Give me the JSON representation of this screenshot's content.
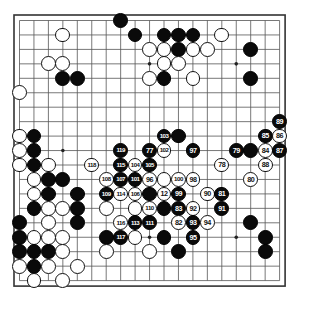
{
  "diagram": {
    "kind": "go-game-record",
    "board_size": 19,
    "colors": {
      "background": "#ffffff",
      "board_fill": "#ffffff",
      "grid_line": "#555555",
      "border_line": "#333333",
      "black_stone": "#0a0a0a",
      "white_stone": "#ffffff",
      "black_label_text": "#ffffff",
      "white_label_text": "#111111"
    },
    "geometry": {
      "origin_x": 19.5,
      "origin_y": 20.5,
      "spacing": 14.45,
      "stone_radius": 7.4,
      "hoshi_radius": 1.8,
      "border_pad": 5.5
    },
    "hoshi": [
      {
        "c": 3,
        "r": 3
      },
      {
        "c": 9,
        "r": 3
      },
      {
        "c": 15,
        "r": 3
      },
      {
        "c": 3,
        "r": 9
      },
      {
        "c": 9,
        "r": 9
      },
      {
        "c": 15,
        "r": 9
      },
      {
        "c": 3,
        "r": 15
      },
      {
        "c": 9,
        "r": 15
      },
      {
        "c": 15,
        "r": 15
      }
    ],
    "stones": [
      {
        "c": 8,
        "r": 1,
        "color": "black",
        "label": ""
      },
      {
        "c": 9,
        "r": 2,
        "color": "black",
        "label": ""
      },
      {
        "c": 11,
        "r": 2,
        "color": "black",
        "label": ""
      },
      {
        "c": 12,
        "r": 2,
        "color": "black",
        "label": ""
      },
      {
        "c": 13,
        "r": 2,
        "color": "black",
        "label": ""
      },
      {
        "c": 4,
        "r": 2,
        "color": "white",
        "label": ""
      },
      {
        "c": 15,
        "r": 2,
        "color": "white",
        "label": ""
      },
      {
        "c": 10,
        "r": 3,
        "color": "white",
        "label": ""
      },
      {
        "c": 11,
        "r": 3,
        "color": "white",
        "label": ""
      },
      {
        "c": 12,
        "r": 3,
        "color": "black",
        "label": ""
      },
      {
        "c": 13,
        "r": 3,
        "color": "white",
        "label": ""
      },
      {
        "c": 14,
        "r": 3,
        "color": "white",
        "label": ""
      },
      {
        "c": 17,
        "r": 3,
        "color": "black",
        "label": ""
      },
      {
        "c": 3,
        "r": 4,
        "color": "white",
        "label": ""
      },
      {
        "c": 4,
        "r": 4,
        "color": "white",
        "label": ""
      },
      {
        "c": 11,
        "r": 4,
        "color": "white",
        "label": ""
      },
      {
        "c": 12,
        "r": 4,
        "color": "white",
        "label": ""
      },
      {
        "c": 4,
        "r": 5,
        "color": "black",
        "label": ""
      },
      {
        "c": 5,
        "r": 5,
        "color": "black",
        "label": ""
      },
      {
        "c": 10,
        "r": 5,
        "color": "white",
        "label": ""
      },
      {
        "c": 11,
        "r": 5,
        "color": "black",
        "label": ""
      },
      {
        "c": 13,
        "r": 5,
        "color": "white",
        "label": ""
      },
      {
        "c": 17,
        "r": 5,
        "color": "black",
        "label": ""
      },
      {
        "c": 1,
        "r": 6,
        "color": "white",
        "label": ""
      },
      {
        "c": 19,
        "r": 8,
        "color": "black",
        "label": "89"
      },
      {
        "c": 1,
        "r": 9,
        "color": "white",
        "label": ""
      },
      {
        "c": 2,
        "r": 9,
        "color": "black",
        "label": ""
      },
      {
        "c": 11,
        "r": 9,
        "color": "black",
        "label": "103"
      },
      {
        "c": 12,
        "r": 9,
        "color": "black",
        "label": ""
      },
      {
        "c": 18,
        "r": 9,
        "color": "black",
        "label": "85"
      },
      {
        "c": 19,
        "r": 9,
        "color": "white",
        "label": "86"
      },
      {
        "c": 1,
        "r": 10,
        "color": "white",
        "label": ""
      },
      {
        "c": 2,
        "r": 10,
        "color": "black",
        "label": ""
      },
      {
        "c": 8,
        "r": 10,
        "color": "black",
        "label": "119"
      },
      {
        "c": 10,
        "r": 10,
        "color": "black",
        "label": "77"
      },
      {
        "c": 11,
        "r": 10,
        "color": "white",
        "label": "102"
      },
      {
        "c": 13,
        "r": 10,
        "color": "black",
        "label": "97"
      },
      {
        "c": 16,
        "r": 10,
        "color": "black",
        "label": "79"
      },
      {
        "c": 17,
        "r": 10,
        "color": "black",
        "label": ""
      },
      {
        "c": 18,
        "r": 10,
        "color": "white",
        "label": "84"
      },
      {
        "c": 19,
        "r": 10,
        "color": "black",
        "label": "87"
      },
      {
        "c": 1,
        "r": 11,
        "color": "white",
        "label": ""
      },
      {
        "c": 2,
        "r": 11,
        "color": "black",
        "label": ""
      },
      {
        "c": 3,
        "r": 11,
        "color": "white",
        "label": ""
      },
      {
        "c": 6,
        "r": 11,
        "color": "white",
        "label": "118"
      },
      {
        "c": 8,
        "r": 11,
        "color": "black",
        "label": "115"
      },
      {
        "c": 9,
        "r": 11,
        "color": "white",
        "label": "104"
      },
      {
        "c": 10,
        "r": 11,
        "color": "black",
        "label": "105"
      },
      {
        "c": 15,
        "r": 11,
        "color": "white",
        "label": "78"
      },
      {
        "c": 18,
        "r": 11,
        "color": "white",
        "label": "88"
      },
      {
        "c": 2,
        "r": 12,
        "color": "white",
        "label": ""
      },
      {
        "c": 3,
        "r": 12,
        "color": "black",
        "label": ""
      },
      {
        "c": 4,
        "r": 12,
        "color": "black",
        "label": ""
      },
      {
        "c": 7,
        "r": 12,
        "color": "white",
        "label": "108"
      },
      {
        "c": 8,
        "r": 12,
        "color": "black",
        "label": "107"
      },
      {
        "c": 9,
        "r": 12,
        "color": "black",
        "label": "101"
      },
      {
        "c": 10,
        "r": 12,
        "color": "white",
        "label": "96"
      },
      {
        "c": 11,
        "r": 12,
        "color": "white",
        "label": ""
      },
      {
        "c": 12,
        "r": 12,
        "color": "white",
        "label": "100"
      },
      {
        "c": 13,
        "r": 12,
        "color": "white",
        "label": "98"
      },
      {
        "c": 17,
        "r": 12,
        "color": "white",
        "label": "80"
      },
      {
        "c": 2,
        "r": 13,
        "color": "white",
        "label": ""
      },
      {
        "c": 3,
        "r": 13,
        "color": "black",
        "label": ""
      },
      {
        "c": 5,
        "r": 13,
        "color": "black",
        "label": ""
      },
      {
        "c": 7,
        "r": 13,
        "color": "black",
        "label": "109"
      },
      {
        "c": 8,
        "r": 13,
        "color": "white",
        "label": "114"
      },
      {
        "c": 9,
        "r": 13,
        "color": "white",
        "label": "106"
      },
      {
        "c": 10,
        "r": 13,
        "color": "black",
        "label": ""
      },
      {
        "c": 11,
        "r": 13,
        "color": "white",
        "label": "12"
      },
      {
        "c": 12,
        "r": 13,
        "color": "black",
        "label": "99"
      },
      {
        "c": 14,
        "r": 13,
        "color": "white",
        "label": "90"
      },
      {
        "c": 15,
        "r": 13,
        "color": "black",
        "label": "81"
      },
      {
        "c": 2,
        "r": 14,
        "color": "black",
        "label": ""
      },
      {
        "c": 3,
        "r": 14,
        "color": "white",
        "label": ""
      },
      {
        "c": 4,
        "r": 14,
        "color": "white",
        "label": ""
      },
      {
        "c": 5,
        "r": 14,
        "color": "black",
        "label": ""
      },
      {
        "c": 7,
        "r": 14,
        "color": "white",
        "label": ""
      },
      {
        "c": 9,
        "r": 14,
        "color": "white",
        "label": ""
      },
      {
        "c": 10,
        "r": 14,
        "color": "white",
        "label": "110"
      },
      {
        "c": 11,
        "r": 14,
        "color": "black",
        "label": ""
      },
      {
        "c": 12,
        "r": 14,
        "color": "black",
        "label": "83"
      },
      {
        "c": 13,
        "r": 14,
        "color": "white",
        "label": "92"
      },
      {
        "c": 15,
        "r": 14,
        "color": "black",
        "label": "91"
      },
      {
        "c": 1,
        "r": 15,
        "color": "black",
        "label": ""
      },
      {
        "c": 3,
        "r": 15,
        "color": "white",
        "label": ""
      },
      {
        "c": 5,
        "r": 15,
        "color": "black",
        "label": ""
      },
      {
        "c": 8,
        "r": 15,
        "color": "white",
        "label": "116"
      },
      {
        "c": 9,
        "r": 15,
        "color": "black",
        "label": "113"
      },
      {
        "c": 10,
        "r": 15,
        "color": "black",
        "label": "111"
      },
      {
        "c": 12,
        "r": 15,
        "color": "white",
        "label": "82"
      },
      {
        "c": 13,
        "r": 15,
        "color": "black",
        "label": "93"
      },
      {
        "c": 14,
        "r": 15,
        "color": "white",
        "label": "94"
      },
      {
        "c": 17,
        "r": 15,
        "color": "black",
        "label": ""
      },
      {
        "c": 1,
        "r": 16,
        "color": "black",
        "label": ""
      },
      {
        "c": 2,
        "r": 16,
        "color": "white",
        "label": ""
      },
      {
        "c": 3,
        "r": 16,
        "color": "white",
        "label": ""
      },
      {
        "c": 4,
        "r": 16,
        "color": "white",
        "label": ""
      },
      {
        "c": 7,
        "r": 16,
        "color": "black",
        "label": ""
      },
      {
        "c": 8,
        "r": 16,
        "color": "black",
        "label": "117"
      },
      {
        "c": 9,
        "r": 16,
        "color": "white",
        "label": ""
      },
      {
        "c": 11,
        "r": 16,
        "color": "black",
        "label": ""
      },
      {
        "c": 13,
        "r": 16,
        "color": "black",
        "label": "95"
      },
      {
        "c": 18,
        "r": 16,
        "color": "black",
        "label": ""
      },
      {
        "c": 1,
        "r": 17,
        "color": "black",
        "label": ""
      },
      {
        "c": 2,
        "r": 17,
        "color": "black",
        "label": ""
      },
      {
        "c": 3,
        "r": 17,
        "color": "black",
        "label": ""
      },
      {
        "c": 4,
        "r": 17,
        "color": "white",
        "label": ""
      },
      {
        "c": 7,
        "r": 17,
        "color": "white",
        "label": ""
      },
      {
        "c": 10,
        "r": 17,
        "color": "white",
        "label": ""
      },
      {
        "c": 12,
        "r": 17,
        "color": "black",
        "label": ""
      },
      {
        "c": 18,
        "r": 17,
        "color": "black",
        "label": ""
      },
      {
        "c": 1,
        "r": 18,
        "color": "white",
        "label": ""
      },
      {
        "c": 2,
        "r": 18,
        "color": "black",
        "label": ""
      },
      {
        "c": 3,
        "r": 18,
        "color": "white",
        "label": ""
      },
      {
        "c": 5,
        "r": 18,
        "color": "white",
        "label": ""
      },
      {
        "c": 2,
        "r": 19,
        "color": "white",
        "label": ""
      },
      {
        "c": 4,
        "r": 19,
        "color": "white",
        "label": ""
      }
    ]
  }
}
